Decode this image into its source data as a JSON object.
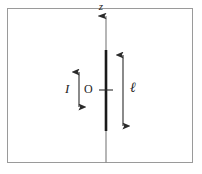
{
  "figure": {
    "background_color": "#ffffff",
    "border_color": "#9a9a9a",
    "stroke_color": "#2b2b2b",
    "axis_color": "#8a8a8a",
    "rod_color": "#1a1a1a",
    "labels": {
      "axis_label": "z",
      "current_label": "I",
      "origin_label": "O",
      "length_label": "ℓ"
    },
    "elements": [
      {
        "name": "frame",
        "kind": "rectangle",
        "x": 7,
        "y": 8,
        "width": 186,
        "height": 155
      },
      {
        "name": "z-axis",
        "kind": "arrow-line",
        "x": 106,
        "y_top": 14,
        "y_bottom": 163,
        "arrowhead": "top"
      },
      {
        "name": "rod",
        "kind": "thick-segment",
        "x": 106,
        "y_top": 50,
        "y_bottom": 131
      },
      {
        "name": "origin-tick",
        "kind": "tick",
        "x": 106,
        "y": 90,
        "half_width": 7
      },
      {
        "name": "current-arrow",
        "kind": "double-arrow",
        "x": 79,
        "y_top": 66,
        "y_bottom": 113
      },
      {
        "name": "length-arrow",
        "kind": "double-arrow",
        "x": 123,
        "y_top": 48,
        "y_bottom": 133
      }
    ]
  }
}
